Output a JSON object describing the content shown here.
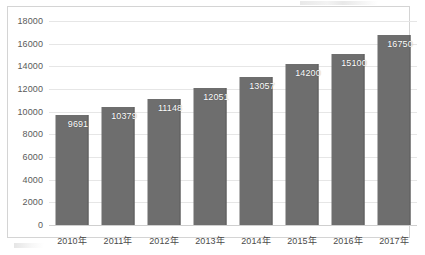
{
  "chart_data": {
    "type": "bar",
    "title": "",
    "subtitle": "",
    "xlabel": "",
    "ylabel": "",
    "categories": [
      "2010年",
      "2011年",
      "2012年",
      "2013年",
      "2014年",
      "2015年",
      "2016年",
      "2017年"
    ],
    "values": [
      9691,
      10379,
      11148,
      12051,
      13057,
      14200,
      15100,
      16750
    ],
    "data_labels": [
      "9691",
      "10379",
      "11148",
      "12051",
      "13057",
      "14200",
      "15100",
      "16750"
    ],
    "ylim": [
      0,
      18000
    ],
    "ytick_labels": [
      "18000",
      "16000",
      "14000",
      "12000",
      "10000",
      "8000",
      "6000",
      "4000",
      "2000",
      "0"
    ],
    "ytick_values": [
      18000,
      16000,
      14000,
      12000,
      10000,
      8000,
      6000,
      4000,
      2000,
      0
    ],
    "grid": true,
    "legend": false,
    "legend_position": "none",
    "series": [
      {
        "name": "",
        "values": [
          9691,
          10379,
          11148,
          12051,
          13057,
          14200,
          15100,
          16750
        ]
      }
    ],
    "colors": {
      "bar_fill": "#6e6e6e",
      "bar_edge": "#5d5d5d",
      "data_label_text": "#ffffff",
      "gridline": "#e6e6e6",
      "axis_line": "#cfcfcf",
      "plot_border": "#d4d4d4",
      "tick_text": "#5a5a5a",
      "category_text": "#4a4a4a",
      "background": "#ffffff"
    }
  }
}
